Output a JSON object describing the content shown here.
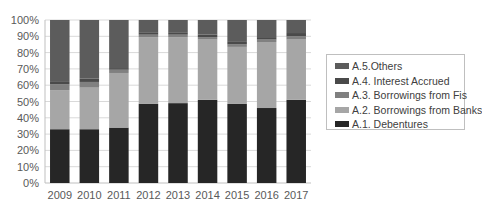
{
  "chart_data": {
    "type": "bar",
    "stacked": true,
    "percent": true,
    "title": "",
    "xlabel": "",
    "ylabel": "",
    "ylim": [
      0,
      100
    ],
    "yticks": [
      "0%",
      "10%",
      "20%",
      "30%",
      "40%",
      "50%",
      "60%",
      "70%",
      "80%",
      "90%",
      "100%"
    ],
    "grid": true,
    "legend_position": "right",
    "categories": [
      "2009",
      "2010",
      "2011",
      "2012",
      "2013",
      "2014",
      "2015",
      "2016",
      "2017"
    ],
    "series": [
      {
        "name": "A.1. Debentures",
        "color": "#262626",
        "values": [
          33,
          33,
          34,
          48.5,
          49,
          51,
          48.5,
          46,
          51
        ]
      },
      {
        "name": "A.2. Borrowings from Banks",
        "color": "#a6a6a6",
        "values": [
          24,
          25.5,
          33.5,
          41,
          40.5,
          37,
          35,
          40.5,
          37
        ]
      },
      {
        "name": "A.3. Borrowings from Fis",
        "color": "#808080",
        "values": [
          3.5,
          3.5,
          2,
          1.5,
          1.5,
          1.5,
          1.5,
          1.5,
          2
        ]
      },
      {
        "name": "A.4. Interest Accrued",
        "color": "#4a4a4a",
        "values": [
          1.5,
          2,
          1,
          1.5,
          1.5,
          1.5,
          2,
          1.5,
          2
        ]
      },
      {
        "name": "A.5.Others",
        "color": "#5c5c5c",
        "values": [
          38,
          36,
          29.5,
          7.5,
          7.5,
          9,
          13,
          10.5,
          8
        ]
      }
    ]
  },
  "legend": {
    "items": [
      {
        "label": "A.5.Others",
        "color": "#5c5c5c"
      },
      {
        "label": "A.4. Interest Accrued",
        "color": "#4a4a4a"
      },
      {
        "label": "A.3. Borrowings from Fis",
        "color": "#808080"
      },
      {
        "label": "A.2. Borrowings from Banks",
        "color": "#a6a6a6"
      },
      {
        "label": "A.1. Debentures",
        "color": "#262626"
      }
    ]
  }
}
